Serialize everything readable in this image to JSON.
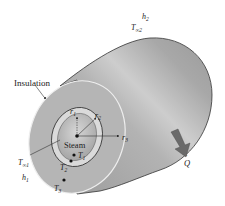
{
  "figure": {
    "type": "diagram",
    "colors": {
      "background": "#ffffff",
      "cylinder_body": "#a9a9a9",
      "cylinder_highlight": "#cfcfcf",
      "insulation_face": "#b4b4b4",
      "pipe_wall": "#dcdcdc",
      "steam_core": "#b9b9b9",
      "outline": "#333333",
      "arrow": "#6a6a6a"
    }
  },
  "labels": {
    "insulation": "Insulation",
    "steam": "Steam",
    "r1": {
      "base": "r",
      "sub": "1"
    },
    "r2": {
      "base": "r",
      "sub": "2"
    },
    "r3": {
      "base": "r",
      "sub": "3"
    },
    "T1": {
      "base": "T",
      "sub": "1"
    },
    "T2": {
      "base": "T",
      "sub": "2"
    },
    "T3": {
      "base": "T",
      "sub": "3"
    },
    "Tinf1": {
      "base": "T",
      "sub": "∞1"
    },
    "Tinf2": {
      "base": "T",
      "sub": "∞2"
    },
    "h1": {
      "base": "h",
      "sub": "1"
    },
    "h2": {
      "base": "h",
      "sub": "2"
    },
    "Q": "Q"
  }
}
